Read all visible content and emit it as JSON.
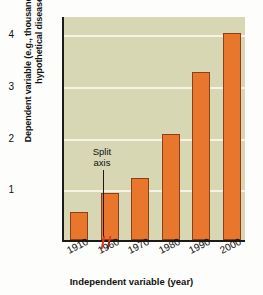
{
  "chart_data": {
    "type": "bar",
    "title": "",
    "xlabel": "Independent variable (year)",
    "ylabel": "Dependent variable (e.g., thousands of cases of a hypothetical disease)",
    "categories": [
      "1910",
      "1960",
      "1970",
      "1980",
      "1990",
      "2000"
    ],
    "values": [
      0.55,
      0.9,
      1.2,
      2.05,
      3.25,
      4.0
    ],
    "ylim": [
      0,
      4.35
    ],
    "yticks": [
      "1",
      "2",
      "3",
      "4"
    ],
    "ytick_values": [
      1,
      2,
      3,
      4
    ],
    "grid": "horizontal",
    "legend": "none",
    "annotations": [
      {
        "text": "Split\naxis",
        "line1": "Split",
        "line2": "axis",
        "points_to": "x-axis break between 1910 and 1960"
      }
    ],
    "colors": {
      "bar_fill": "#e8772d",
      "bar_stroke": "#8a3f16",
      "plot_background": "#d7d7b4",
      "gridline": "#f4f3e6",
      "axis": "#1b1b1b",
      "split_marker": "#e23a20",
      "page_background": "#fdfdfb"
    }
  },
  "axis_labels": {
    "y_title": "Dependent variable (e.g., thousands of cases of a hypothetical disease)",
    "x_title": "Independent variable (year)"
  },
  "annotation": {
    "line1": "Split",
    "line2": "axis"
  }
}
